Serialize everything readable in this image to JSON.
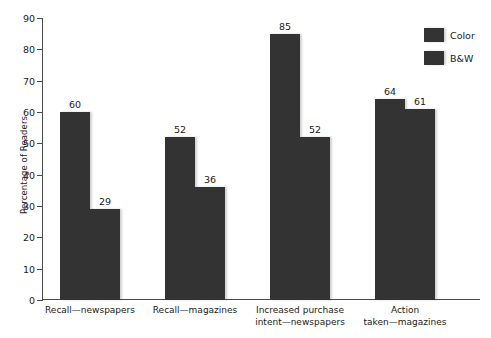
{
  "chart_data": {
    "type": "bar",
    "title": "",
    "xlabel": "",
    "ylabel": "Percentage of Readers",
    "ylim": [
      0,
      90
    ],
    "ytick_step": 10,
    "yticks": [
      0,
      10,
      20,
      30,
      40,
      50,
      60,
      70,
      80,
      90
    ],
    "grid": false,
    "legend_position": "top-right",
    "categories": [
      "Recall—newspapers",
      "Recall—magazines",
      "Increased purchase\nintent—newspapers",
      "Action\ntaken—magazines"
    ],
    "series": [
      {
        "name": "Color",
        "values": [
          60,
          52,
          85,
          64
        ],
        "color": "#333333"
      },
      {
        "name": "B&W",
        "values": [
          29,
          36,
          52,
          61
        ],
        "color": "#333333"
      }
    ]
  },
  "legend": {
    "items": [
      {
        "label": "Color"
      },
      {
        "label": "B&W"
      }
    ]
  }
}
